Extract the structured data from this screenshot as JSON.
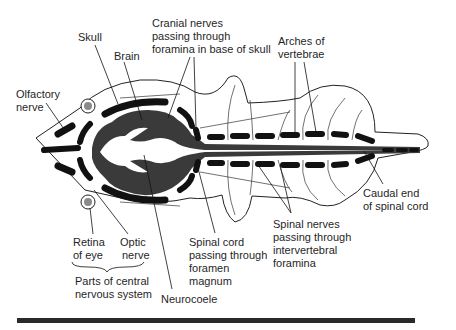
{
  "figure": {
    "labels": {
      "skull": [
        "Skull"
      ],
      "brain": [
        "Brain"
      ],
      "cranial_nerves": [
        "Cranial nerves",
        "passing through",
        "foramina in base of skull"
      ],
      "arches": [
        "Arches of",
        "vertebrae"
      ],
      "olfactory": [
        "Olfactory",
        "nerve"
      ],
      "caudal": [
        "Caudal end",
        "of spinal cord"
      ],
      "retina": [
        "Retina",
        "of eye"
      ],
      "optic": [
        "Optic",
        "nerve"
      ],
      "cns_group": [
        "Parts of central",
        "nervous system"
      ],
      "spinal_cord": [
        "Spinal cord",
        "passing through",
        "foramen",
        "magnum"
      ],
      "spinal_nerves": [
        "Spinal nerves",
        "passing through",
        "intervertebral",
        "foramina"
      ],
      "neurocoele": [
        "Neurocoele"
      ]
    },
    "colors": {
      "nervous_tissue": "#3a3a3a",
      "bone": "#111111",
      "outline": "#222222",
      "eye": "#8a8a8a",
      "background": "#ffffff"
    }
  }
}
